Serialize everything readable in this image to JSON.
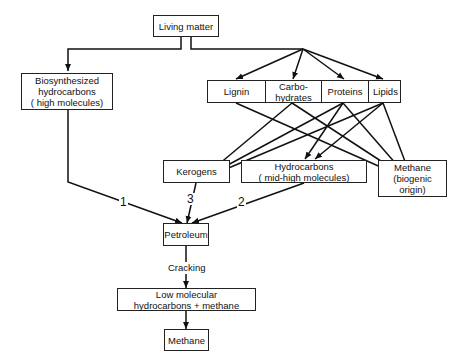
{
  "nodes": {
    "living_matter": "Living matter",
    "biosynthesized": "Biosynthesized\nhydrocarbons\n( high molecules)",
    "components": [
      "Lignin",
      "Carbo-\nhydrates",
      "Proteins",
      "Lipids"
    ],
    "kerogens": "Kerogens",
    "hydrocarbons_mid": "Hydrocarbons\n( mid-high molecules)",
    "methane_biogenic": "Methane\n(biogenic origin)",
    "petroleum": "Petroleum",
    "low_molecular": "Low molecular\nhydrocarbons + methane",
    "methane": "Methane"
  },
  "edge_labels": {
    "path1": "1",
    "path2": "2",
    "path3": "3",
    "cracking": "Cracking"
  }
}
